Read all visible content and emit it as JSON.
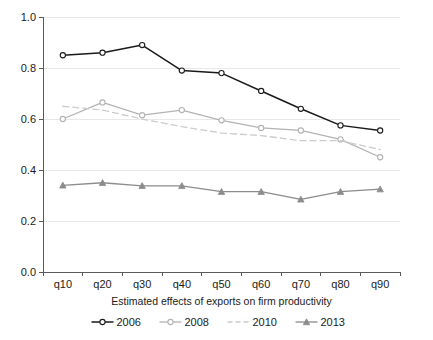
{
  "chart_data": {
    "type": "line",
    "title": "",
    "subtitle": "",
    "xlabel": "Estimated effects of exports on firm productivity",
    "ylabel": "",
    "categories": [
      "q10",
      "q20",
      "q30",
      "q40",
      "q50",
      "q60",
      "q70",
      "q80",
      "q90"
    ],
    "xtick_labels": [
      "q10",
      "q20",
      "q30",
      "q40",
      "q50",
      "q60",
      "q70",
      "q80",
      "q90"
    ],
    "ytick_labels": [
      "0.0",
      "0.2",
      "0.4",
      "0.6",
      "0.8",
      "1.0"
    ],
    "ytick_values": [
      0.0,
      0.2,
      0.4,
      0.6,
      0.8,
      1.0
    ],
    "ylim": [
      0.0,
      1.0
    ],
    "grid": "horizontal",
    "legend_position": "bottom",
    "series": [
      {
        "name": "2006",
        "color": "#1a1a1a",
        "marker": "circle-open",
        "dash": "solid",
        "values": [
          0.85,
          0.86,
          0.89,
          0.79,
          0.78,
          0.71,
          0.64,
          0.575,
          0.555
        ]
      },
      {
        "name": "2008",
        "color": "#b3b3b3",
        "marker": "circle-open",
        "dash": "solid",
        "values": [
          0.6,
          0.665,
          0.615,
          0.635,
          0.595,
          0.565,
          0.555,
          0.52,
          0.45
        ]
      },
      {
        "name": "2010",
        "color": "#cccccc",
        "marker": "none",
        "dash": "dashed",
        "values": [
          0.65,
          0.635,
          0.6,
          0.57,
          0.545,
          0.535,
          0.515,
          0.515,
          0.48
        ]
      },
      {
        "name": "2013",
        "color": "#8c8c8c",
        "marker": "triangle",
        "dash": "solid",
        "values": [
          0.34,
          0.35,
          0.338,
          0.338,
          0.315,
          0.315,
          0.285,
          0.315,
          0.325
        ]
      }
    ]
  },
  "legend": {
    "items": [
      {
        "label": "2006"
      },
      {
        "label": "2008"
      },
      {
        "label": "2010"
      },
      {
        "label": "2013"
      }
    ]
  },
  "axis": {
    "x_title": "Estimated effects of exports on firm productivity"
  }
}
